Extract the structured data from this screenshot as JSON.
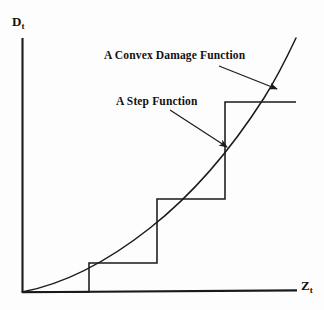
{
  "figure": {
    "background_color": "#fdfdfd",
    "ink_color": "#1a1a1a"
  },
  "axes": {
    "y_label_main": "D",
    "y_label_sub": "t",
    "x_label_main": "Z",
    "x_label_sub": "t",
    "origin": {
      "x": 22,
      "y": 292
    },
    "y_axis_top": {
      "x": 22,
      "y": 38
    },
    "x_axis_right": {
      "x": 297,
      "y": 291
    }
  },
  "annotations": {
    "convex": {
      "text": "A Convex Damage Function",
      "arrow_from": {
        "x": 219,
        "y": 66
      },
      "arrow_to": {
        "x": 277,
        "y": 89
      }
    },
    "step": {
      "text": "A Step Function",
      "arrow_from": {
        "x": 170,
        "y": 110
      },
      "arrow_to": {
        "x": 227,
        "y": 147
      }
    }
  },
  "chart_data": {
    "type": "line",
    "title": "",
    "xlabel": "Z_t",
    "ylabel": "D_t",
    "grid": false,
    "legend": "none",
    "xlim": [
      0,
      1
    ],
    "ylim": [
      0,
      1
    ],
    "series": [
      {
        "name": "A Convex Damage Function",
        "type": "curve",
        "points": [
          [
            22,
            292
          ],
          [
            46,
            285
          ],
          [
            70,
            276
          ],
          [
            89,
            267
          ],
          [
            110,
            255
          ],
          [
            134,
            240
          ],
          [
            157,
            222
          ],
          [
            180,
            201
          ],
          [
            203,
            176
          ],
          [
            225,
            148
          ],
          [
            246,
            117
          ],
          [
            266,
            84
          ],
          [
            282,
            58
          ],
          [
            296,
            38
          ]
        ]
      },
      {
        "name": "A Step Function",
        "type": "step",
        "points": [
          [
            22,
            292
          ],
          [
            89,
            292
          ],
          [
            89,
            263
          ],
          [
            157,
            263
          ],
          [
            157,
            199
          ],
          [
            225,
            199
          ],
          [
            225,
            102
          ],
          [
            296,
            102
          ]
        ],
        "risers": [
          {
            "x": 89,
            "y_bottom": 292,
            "y_top": 263
          },
          {
            "x": 157,
            "y_bottom": 263,
            "y_top": 199
          },
          {
            "x": 225,
            "y_bottom": 199,
            "y_top": 102
          }
        ],
        "treads": [
          {
            "y": 263,
            "x_start": 89,
            "x_end": 157
          },
          {
            "y": 199,
            "x_start": 157,
            "x_end": 225
          },
          {
            "y": 102,
            "x_start": 225,
            "x_end": 296
          }
        ]
      }
    ]
  }
}
